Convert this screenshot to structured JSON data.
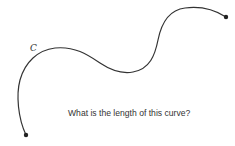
{
  "diagram": {
    "curve_label": "C",
    "question": "What is the length of this curve?",
    "colors": {
      "curve": "#333333",
      "text": "#333333",
      "background": "#ffffff"
    },
    "endpoints": [
      {
        "name": "start",
        "x": 26,
        "y": 135
      },
      {
        "name": "end",
        "x": 226,
        "y": 17
      }
    ]
  }
}
